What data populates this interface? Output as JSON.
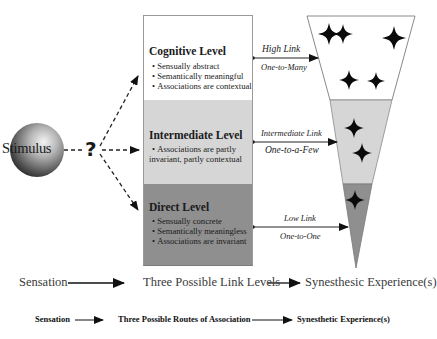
{
  "stimulus": {
    "label": "Stimulus",
    "question_mark": "?"
  },
  "levels": [
    {
      "title": "Cognitive Level",
      "items": [
        "Sensually abstract",
        "Semantically meaningful",
        "Associations are contextual"
      ],
      "color": "#ffffff",
      "link": {
        "name": "High Link",
        "ratio": "One-to-Many"
      }
    },
    {
      "title": "Intermediate Level",
      "items": [
        "Associations are partly",
        "invariant, partly contextual"
      ],
      "color": "#d6d6d6",
      "link": {
        "name": "Intermediate Link",
        "ratio": "One-to-a-Few"
      }
    },
    {
      "title": "Direct Level",
      "items": [
        "Sensually concrete",
        "Semantically meaningless",
        "Associations are invariant"
      ],
      "color": "#8f8f8f",
      "link": {
        "name": "Low Link",
        "ratio": "One-to-One"
      }
    }
  ],
  "funnel": {
    "star_counts": {
      "white": 5,
      "light": 2,
      "dark": 1
    }
  },
  "flow_row_1": [
    "Sensation",
    "Three Possible Link Levels",
    "Synesthesic Experience(s)"
  ],
  "flow_row_2": [
    "Sensation",
    "Three Possible Routes of Association",
    "Synesthetic Experience(s)"
  ]
}
